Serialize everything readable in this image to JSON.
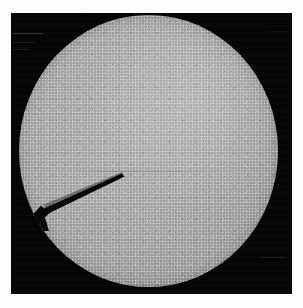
{
  "figure": {
    "kind": "micrograph",
    "caption": "",
    "frame": {
      "background_color": "#050505",
      "left": 11,
      "top": 13,
      "width": 281,
      "height": 281
    },
    "page_background_color": "#ffffff"
  },
  "specimen": {
    "label": "specimen-disc",
    "shape": "circle",
    "fill_color": "#b2b2b2",
    "rim_color": "#9c9c9c",
    "texture": "granular-speckle",
    "center_x": 148,
    "center_y": 151,
    "width": 259,
    "height": 272
  },
  "defect": {
    "label": "wedge-notch",
    "shape": "wedge",
    "color": "#070707",
    "tip_x": 113,
    "tip_y": 173,
    "base_x": 35,
    "base_y": 216,
    "description": "dark wedge-shaped notch in lower-left quadrant"
  },
  "artifacts": {
    "scan_banding": "horizontal",
    "streak_count": 5,
    "seam": "faint horizontal seam across disc midline"
  }
}
